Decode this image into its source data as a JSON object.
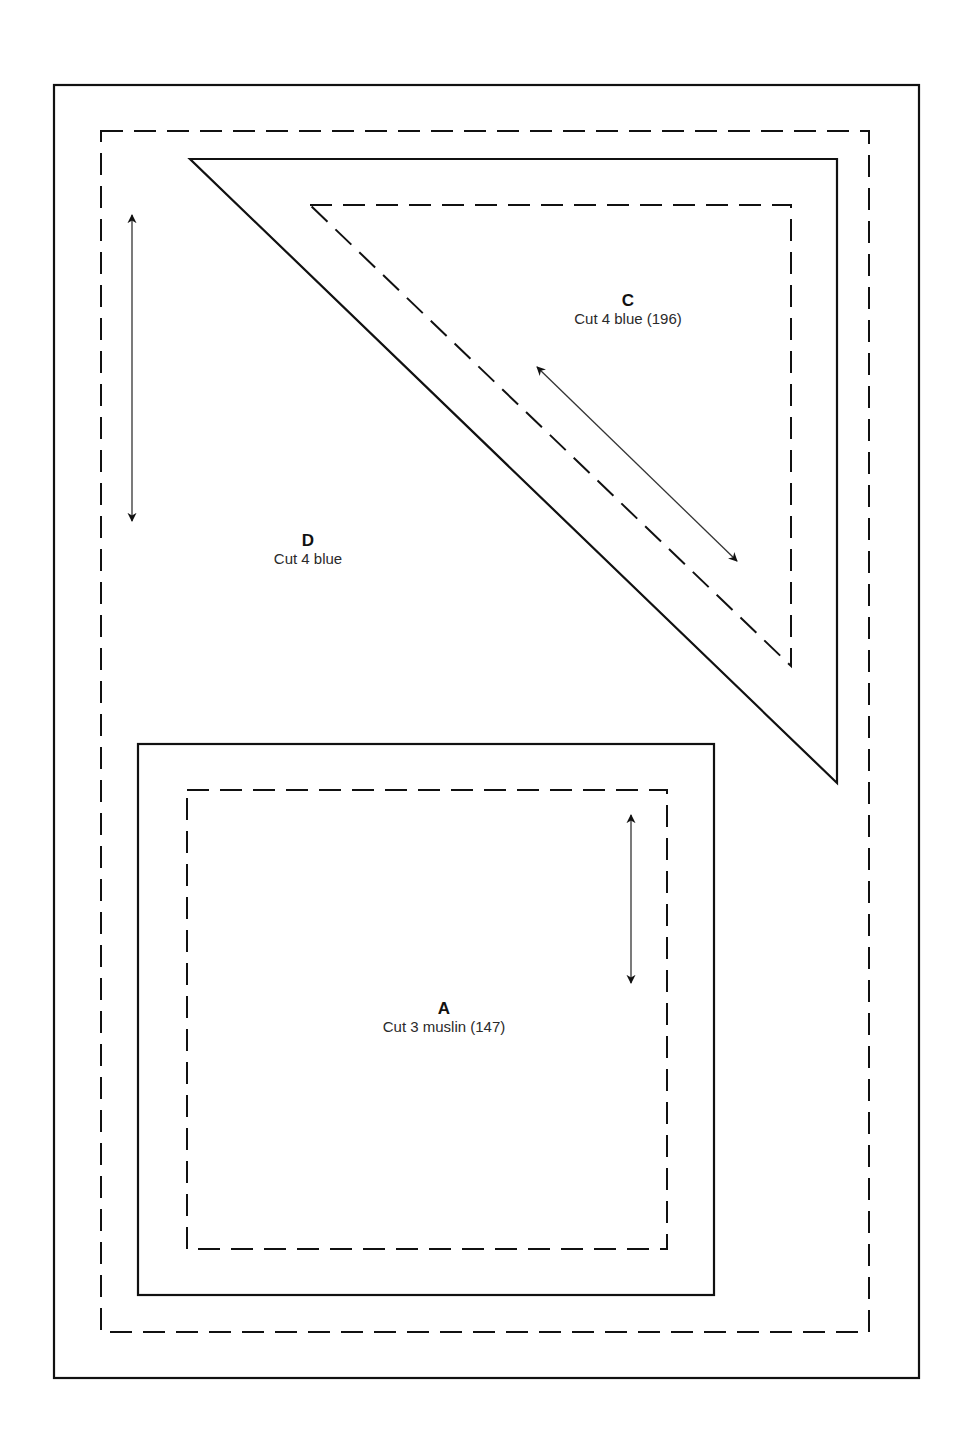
{
  "colors": {
    "stroke": "#111111",
    "background": "#ffffff",
    "arrow": "#333333"
  },
  "pieces": [
    {
      "id": "C",
      "letter": "C",
      "description": "Cut 4 blue (196)",
      "shape": "triangle"
    },
    {
      "id": "D",
      "letter": "D",
      "description": "Cut 4 blue",
      "shape": "rectangle"
    },
    {
      "id": "A",
      "letter": "A",
      "description": "Cut 3 muslin (147)",
      "shape": "square"
    }
  ],
  "legend": {
    "solid_line": "cutting line",
    "dashed_line": "seam line",
    "arrow": "grain line"
  }
}
